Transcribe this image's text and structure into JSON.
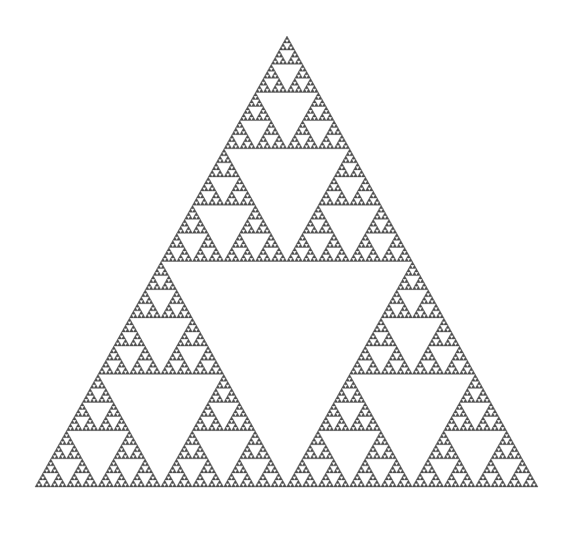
{
  "figure": {
    "type": "fractal",
    "name": "sierpinski-triangle",
    "alt_names": [
      "Sierpinski gasket",
      "Sierpinski sieve"
    ],
    "background_color": "#ffffff",
    "fill_color": "#4f4f4f",
    "stroke_color": "#4f4f4f",
    "canvas": {
      "width": 571,
      "height": 533
    }
  },
  "chart_data": {
    "type": "scatter",
    "subtitle": "",
    "xlabel": "",
    "ylabel": "",
    "grid": false,
    "legend": null,
    "axes_visible": false,
    "xlim": [
      0,
      571
    ],
    "ylim": [
      0,
      533
    ],
    "construction": {
      "method": "recursive-subdivision",
      "base_shape": "equilateral-triangle",
      "recursion_depth": 7,
      "removed_subtriangle": "inverted-middle",
      "triangles_at_final_depth": 2187
    },
    "vertices": {
      "apex": [
        287,
        36
      ],
      "bottom_left": [
        35,
        487
      ],
      "bottom_right": [
        538,
        487
      ]
    },
    "dimensions": {
      "base_width_px": 503,
      "height_px": 451,
      "hausdorff_dimension": 1.585
    }
  },
  "colors": {
    "ink": "#4f4f4f",
    "paper": "#ffffff"
  }
}
